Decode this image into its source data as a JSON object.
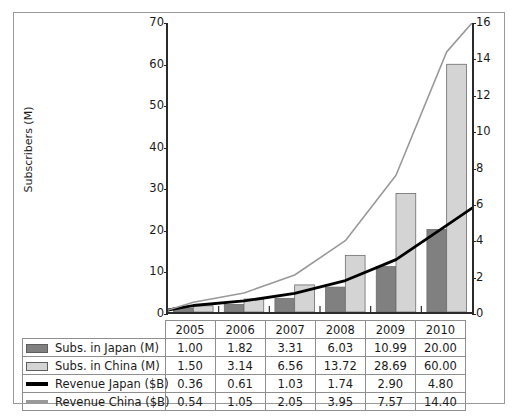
{
  "chart_data": {
    "type": "bar",
    "title": "",
    "xlabel": "",
    "ylabel": "Subscribers (M)",
    "y2label": "Revenue ($B)",
    "categories": [
      "2005",
      "2006",
      "2007",
      "2008",
      "2009",
      "2010"
    ],
    "ylim": [
      0,
      70
    ],
    "y2lim": [
      0,
      16
    ],
    "yticks": [
      0,
      10,
      20,
      30,
      40,
      50,
      60,
      70
    ],
    "y2ticks": [
      0,
      2,
      4,
      6,
      8,
      10,
      12,
      14,
      16
    ],
    "grid": false,
    "legend_position": "table-below",
    "series": [
      {
        "name": "Subs. in Japan (M)",
        "type": "bar",
        "axis": "left",
        "color": "#808080",
        "values": [
          1.0,
          1.82,
          3.31,
          6.03,
          10.99,
          20.0
        ]
      },
      {
        "name": "Subs. in China (M)",
        "type": "bar",
        "axis": "left",
        "color": "#d4d4d4",
        "values": [
          1.5,
          3.14,
          6.56,
          13.72,
          28.69,
          60.0
        ]
      },
      {
        "name": "Revenue Japan ($B)",
        "type": "line",
        "axis": "right",
        "color": "#000000",
        "values": [
          0.36,
          0.61,
          1.03,
          1.74,
          2.9,
          4.8
        ]
      },
      {
        "name": "Revenue China ($B)",
        "type": "line",
        "axis": "right",
        "color": "#999999",
        "values": [
          0.54,
          1.05,
          2.05,
          3.95,
          7.57,
          14.4
        ]
      }
    ]
  },
  "axes": {
    "left_title": "Subscribers (M)",
    "right_title": "Revenue ($B)",
    "left_ticks": [
      "70",
      "60",
      "50",
      "40",
      "30",
      "20",
      "10",
      "0"
    ],
    "right_ticks": [
      "16",
      "14",
      "12",
      "10",
      "8",
      "6",
      "4",
      "2",
      "0"
    ]
  },
  "table": {
    "corner": "",
    "years": [
      "2005",
      "2006",
      "2007",
      "2008",
      "2009",
      "2010"
    ],
    "rows": [
      {
        "label": "Subs. in Japan (M)",
        "swatch": "box",
        "color": "#808080",
        "values": [
          "1.00",
          "1.82",
          "3.31",
          "6.03",
          "10.99",
          "20.00"
        ]
      },
      {
        "label": "Subs. in China (M)",
        "swatch": "box",
        "color": "#d4d4d4",
        "values": [
          "1.50",
          "3.14",
          "6.56",
          "13.72",
          "28.69",
          "60.00"
        ]
      },
      {
        "label": "Revenue Japan ($B)",
        "swatch": "line",
        "color": "#000000",
        "values": [
          "0.36",
          "0.61",
          "1.03",
          "1.74",
          "2.90",
          "4.80"
        ]
      },
      {
        "label": "Revenue China ($B)",
        "swatch": "line",
        "color": "#999999",
        "values": [
          "0.54",
          "1.05",
          "2.05",
          "3.95",
          "7.57",
          "14.40"
        ]
      }
    ]
  }
}
